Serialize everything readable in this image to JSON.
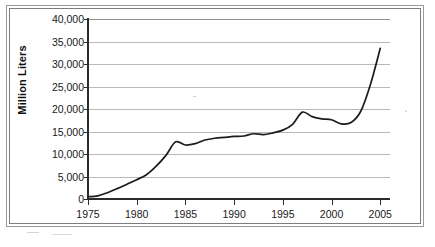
{
  "figure": {
    "background_color": "#ffffff",
    "frame_color": "#8f8f8f",
    "line_color": "#1c1c1c",
    "gridline_color": "#b9b9b9",
    "axis_color": "#2b2b2b"
  },
  "chart_data": {
    "type": "line",
    "title": "",
    "subtitle": "",
    "xlabel": "",
    "ylabel": "Million Liters",
    "xlim": [
      1975,
      2006
    ],
    "ylim": [
      0,
      40000
    ],
    "grid": true,
    "legend_position": "none",
    "x_tick_labels": [
      "1975",
      "1980",
      "1985",
      "1990",
      "1995",
      "2000",
      "2005"
    ],
    "x_ticks": [
      1975,
      1980,
      1985,
      1990,
      1995,
      2000,
      2005
    ],
    "y_tick_labels": [
      "0",
      "5,000",
      "10,000",
      "15,000",
      "20,000",
      "25,000",
      "30,000",
      "35,000",
      "40,000"
    ],
    "y_ticks": [
      0,
      5000,
      10000,
      15000,
      20000,
      25000,
      30000,
      35000,
      40000
    ],
    "series": [
      {
        "name": "Million Liters",
        "color": "#1c1c1c",
        "x": [
          1975,
          1976,
          1977,
          1978,
          1979,
          1980,
          1981,
          1982,
          1983,
          1984,
          1985,
          1986,
          1987,
          1988,
          1989,
          1990,
          1991,
          1992,
          1993,
          1994,
          1995,
          1996,
          1997,
          1998,
          1999,
          2000,
          2001,
          2002,
          2003,
          2004,
          2005
        ],
        "values": [
          500,
          700,
          1400,
          2300,
          3300,
          4300,
          5400,
          7300,
          9700,
          12700,
          12000,
          12300,
          13100,
          13500,
          13700,
          13900,
          14000,
          14500,
          14300,
          14700,
          15300,
          16600,
          19300,
          18300,
          17800,
          17600,
          16700,
          17000,
          19500,
          25500,
          33500
        ]
      }
    ]
  },
  "annotations": []
}
